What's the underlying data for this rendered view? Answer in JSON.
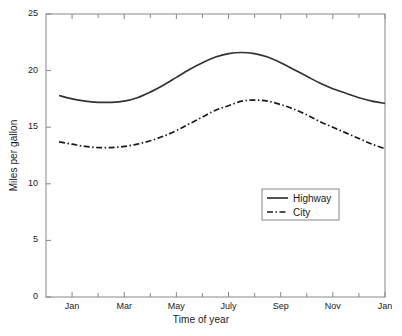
{
  "chart_data": {
    "type": "line",
    "title": "",
    "xlabel": "Time of year",
    "ylabel": "Miles per gallon",
    "ylim": [
      0,
      25
    ],
    "yticks": [
      0,
      5,
      10,
      15,
      20,
      25
    ],
    "ytick_labels": [
      "0",
      "5",
      "10",
      "15",
      "20",
      "25"
    ],
    "xlim": [
      0,
      13
    ],
    "xtick_labels": [
      "Jan",
      "Mar",
      "May",
      "July",
      "Sep",
      "Nov",
      "Jan"
    ],
    "xtick_positions": [
      1,
      3,
      5,
      7,
      9,
      11,
      13
    ],
    "minor_xtick_positions": [
      2,
      4,
      6,
      8,
      10,
      12
    ],
    "grid": false,
    "legend_position": "lower right",
    "x": [
      0.5,
      1,
      1.5,
      2,
      2.5,
      3,
      3.5,
      4,
      4.5,
      5,
      5.5,
      6,
      6.5,
      7,
      7.5,
      8,
      8.5,
      9,
      9.5,
      10,
      10.5,
      11,
      11.5,
      12,
      12.5,
      13
    ],
    "series": [
      {
        "name": "Highway",
        "style": "solid",
        "color": "#333333",
        "values": [
          17.8,
          17.5,
          17.3,
          17.2,
          17.2,
          17.3,
          17.6,
          18.1,
          18.7,
          19.4,
          20.1,
          20.7,
          21.2,
          21.5,
          21.6,
          21.5,
          21.2,
          20.7,
          20.1,
          19.5,
          18.9,
          18.4,
          18.0,
          17.6,
          17.3,
          17.1
        ]
      },
      {
        "name": "City",
        "style": "dashdot",
        "color": "#1a1a1a",
        "values": [
          13.7,
          13.5,
          13.3,
          13.2,
          13.2,
          13.3,
          13.5,
          13.8,
          14.2,
          14.7,
          15.3,
          15.9,
          16.5,
          16.9,
          17.3,
          17.4,
          17.3,
          17.0,
          16.6,
          16.1,
          15.5,
          15.0,
          14.5,
          14.0,
          13.5,
          13.1
        ]
      }
    ],
    "legend_entries": [
      {
        "label": "Highway",
        "style": "solid"
      },
      {
        "label": "City",
        "style": "dashdot"
      }
    ]
  }
}
